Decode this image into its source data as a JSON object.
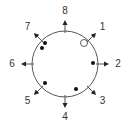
{
  "diagram": {
    "type": "circular-direction-diagram",
    "center": [
      65,
      64
    ],
    "radius": 33,
    "directions": [
      {
        "label": "1",
        "angle_deg": 45
      },
      {
        "label": "2",
        "angle_deg": 90
      },
      {
        "label": "3",
        "angle_deg": 135
      },
      {
        "label": "4",
        "angle_deg": 180
      },
      {
        "label": "5",
        "angle_deg": 225
      },
      {
        "label": "6",
        "angle_deg": 270
      },
      {
        "label": "7",
        "angle_deg": 315
      },
      {
        "label": "8",
        "angle_deg": 0
      }
    ],
    "points": [
      {
        "x": 84,
        "y": 43,
        "filled": false
      },
      {
        "x": 45,
        "y": 43,
        "filled": true
      },
      {
        "x": 42,
        "y": 48,
        "filled": true
      },
      {
        "x": 93,
        "y": 63,
        "filled": true
      },
      {
        "x": 45,
        "y": 83,
        "filled": true
      },
      {
        "x": 76,
        "y": 89,
        "filled": true
      }
    ],
    "colors": {
      "stroke": "#555555",
      "text": "#333333",
      "dot": "#111111"
    }
  }
}
